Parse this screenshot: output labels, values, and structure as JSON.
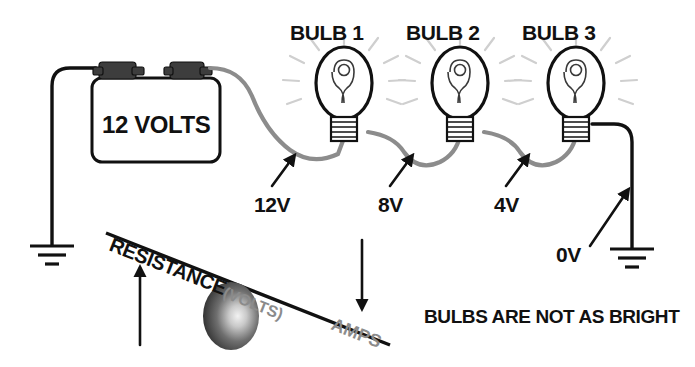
{
  "diagram": {
    "title_text_visible": false,
    "battery": {
      "label": "12 VOLTS",
      "terminal_left": "battery-terminal-left",
      "terminal_right": "battery-terminal-right"
    },
    "bulbs": [
      {
        "name": "BULB 1",
        "id": "bulb-1"
      },
      {
        "name": "BULB 2",
        "id": "bulb-2"
      },
      {
        "name": "BULB 3",
        "id": "bulb-3"
      }
    ],
    "voltage_labels": [
      {
        "value": "12V",
        "at": "before-bulb-1"
      },
      {
        "value": "8V",
        "at": "between-bulb-1-and-2"
      },
      {
        "value": "4V",
        "at": "between-bulb-2-and-3"
      },
      {
        "value": "0V",
        "at": "after-bulb-3-ground"
      }
    ],
    "seesaw": {
      "left_label": "RESISTANCE",
      "left_sublabel": "(VOLTS)",
      "right_label": "AMPS",
      "left_arrow_direction": "up",
      "right_arrow_direction": "down"
    },
    "caption": "BULBS ARE NOT AS BRIGHT",
    "colors": {
      "wire_gray": "#8c8c8c",
      "wire_black": "#111111",
      "text_black": "#111111",
      "text_gray": "#8b8b8b",
      "ray_gray": "#cfcfcf",
      "terminal_gray": "#3d3d3d",
      "background": "#ffffff"
    }
  }
}
